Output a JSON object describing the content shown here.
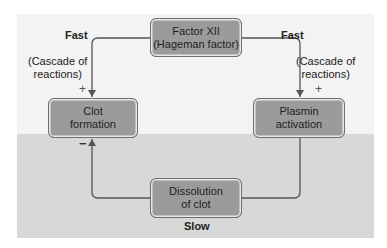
{
  "diagram": {
    "nodes": {
      "factor": {
        "line1": "Factor XII",
        "line2": "(Hageman factor)"
      },
      "clot": {
        "line1": "Clot",
        "line2": "formation"
      },
      "plasmin": {
        "line1": "Plasmin",
        "line2": "activation"
      },
      "dissolution": {
        "line1": "Dissolution",
        "line2": "of clot"
      }
    },
    "labels": {
      "fast_left": "Fast",
      "fast_right": "Fast",
      "cascade_left_line1": "(Cascade of",
      "cascade_left_line2": "reactions)",
      "cascade_right_line1": "(Cascade of",
      "cascade_right_line2": "reactions)",
      "plus_left": "+",
      "plus_right": "+",
      "minus": "−",
      "slow": "Slow"
    },
    "edges": [
      {
        "from": "factor",
        "to": "clot",
        "sign": "+",
        "speed": "Fast"
      },
      {
        "from": "factor",
        "to": "plasmin",
        "sign": "+",
        "speed": "Fast"
      },
      {
        "from": "plasmin",
        "to": "dissolution",
        "sign": "",
        "speed": "Slow"
      },
      {
        "from": "dissolution",
        "to": "clot",
        "sign": "−",
        "speed": "Slow"
      }
    ],
    "colors": {
      "upper_panel": "#f3f3f3",
      "lower_panel": "#d8d8d8",
      "box_fill": "#9b9b9b",
      "box_border": "#6e6e6e",
      "line": "#555555"
    }
  }
}
